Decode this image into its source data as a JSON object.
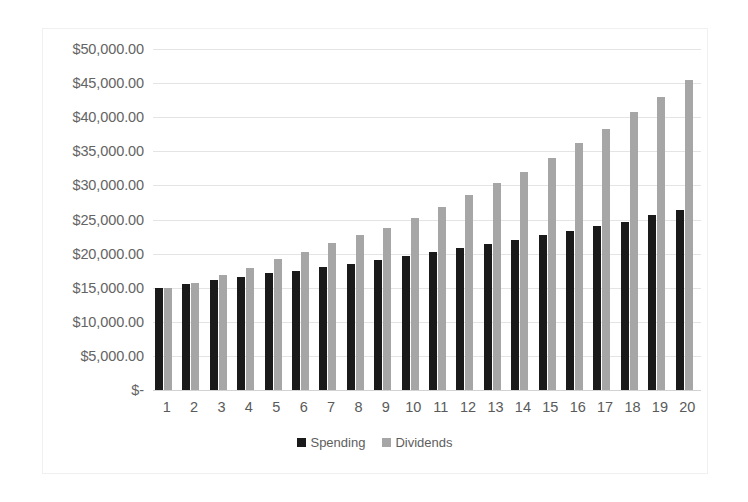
{
  "chart_data": {
    "type": "bar",
    "title": "",
    "subtitle": "",
    "xlabel": "",
    "ylabel": "",
    "ylim": [
      0,
      50000
    ],
    "ytick_step": 5000,
    "grid": true,
    "legend_position": "bottom",
    "categories": [
      "1",
      "2",
      "3",
      "4",
      "5",
      "6",
      "7",
      "8",
      "9",
      "10",
      "11",
      "12",
      "13",
      "14",
      "15",
      "16",
      "17",
      "18",
      "19",
      "20"
    ],
    "ytick_labels": [
      "$50,000.00",
      "$45,000.00",
      "$40,000.00",
      "$35,000.00",
      "$30,000.00",
      "$25,000.00",
      "$20,000.00",
      "$15,000.00",
      "$10,000.00",
      "$5,000.00",
      "$-"
    ],
    "ytick_values": [
      50000,
      45000,
      40000,
      35000,
      30000,
      25000,
      20000,
      15000,
      10000,
      5000,
      0
    ],
    "series": [
      {
        "name": "Spending",
        "color": "#1a1a1a",
        "values": [
          15000,
          15500,
          16100,
          16600,
          17100,
          17500,
          18000,
          18500,
          19000,
          19600,
          20200,
          20800,
          21400,
          22000,
          22700,
          23300,
          24000,
          24700,
          25600,
          26400
        ]
      },
      {
        "name": "Dividends",
        "color": "#a6a6a6",
        "values": [
          15000,
          15700,
          16800,
          17900,
          19200,
          20300,
          21500,
          22700,
          23800,
          25200,
          26800,
          28600,
          30300,
          32000,
          34000,
          36200,
          38200,
          40700,
          42900,
          45400
        ]
      }
    ]
  },
  "legend": {
    "items": [
      {
        "label": "Spending",
        "color": "#1a1a1a"
      },
      {
        "label": "Dividends",
        "color": "#a6a6a6"
      }
    ]
  }
}
